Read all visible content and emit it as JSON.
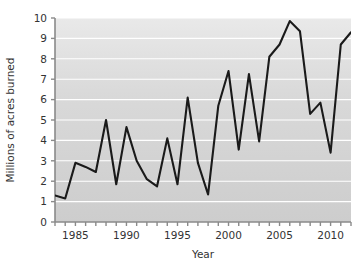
{
  "chart_data": {
    "type": "line",
    "title": "",
    "xlabel": "Year",
    "ylabel": "Millions of acres burned",
    "xlim": [
      1983,
      2012
    ],
    "ylim": [
      0,
      10
    ],
    "grid": "horizontal",
    "legend": "none",
    "line_color": "#1a1a1a",
    "plot_background": "#d0d0d0",
    "gridline_color": "#ffffff",
    "x_tick_labels": [
      "1985",
      "1990",
      "1995",
      "2000",
      "2005",
      "2010"
    ],
    "x_tick_label_values": [
      1985,
      1990,
      1995,
      2000,
      2005,
      2010
    ],
    "x_minor_tick_interval": 1,
    "y_tick_labels": [
      "0",
      "1",
      "2",
      "3",
      "4",
      "5",
      "6",
      "7",
      "8",
      "9",
      "10"
    ],
    "y_tick_values": [
      0,
      1,
      2,
      3,
      4,
      5,
      6,
      7,
      8,
      9,
      10
    ],
    "x": [
      1983,
      1984,
      1985,
      1986,
      1987,
      1988,
      1989,
      1990,
      1991,
      1992,
      1993,
      1994,
      1995,
      1996,
      1997,
      1998,
      1999,
      2000,
      2001,
      2002,
      2003,
      2004,
      2005,
      2006,
      2007,
      2008,
      2009,
      2010,
      2011,
      2012
    ],
    "values": [
      1.3,
      1.15,
      2.9,
      2.7,
      2.45,
      5.0,
      1.85,
      4.65,
      3.0,
      2.1,
      1.75,
      4.1,
      1.85,
      6.1,
      2.9,
      1.35,
      5.7,
      7.4,
      3.55,
      7.25,
      3.95,
      8.1,
      8.7,
      9.85,
      9.35,
      5.3,
      5.85,
      3.4,
      8.7,
      9.3
    ],
    "series_name": "acres burned"
  },
  "axes": {
    "x_axis_title": "Year",
    "y_axis_title": "Millions of acres burned"
  }
}
